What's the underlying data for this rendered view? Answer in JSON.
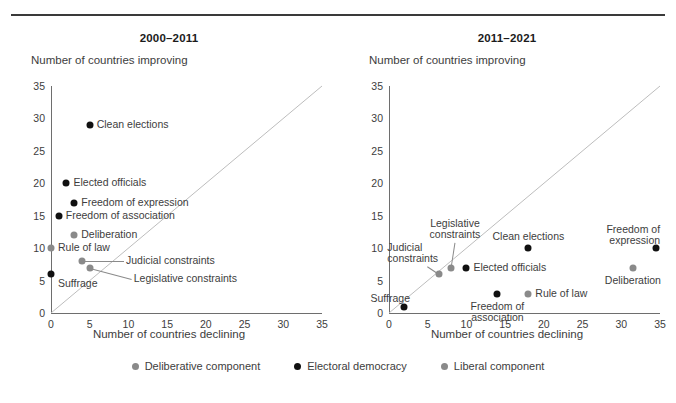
{
  "figure": {
    "x_axis_label": "Number of countries declining",
    "y_axis_label": "Number of countries improving",
    "ticks": [
      "0",
      "5",
      "10",
      "15",
      "20",
      "25",
      "30",
      "35"
    ],
    "colors": {
      "electoral_democracy": "#111111",
      "deliberative_component": "#8a8a8a",
      "liberal_component": "#8a8a8a",
      "axis": "#6e6e6e",
      "rule": "#3a3a3a",
      "text": "#3d3d3d"
    }
  },
  "legend": {
    "items": [
      {
        "label": "Deliberative component",
        "color": "#8a8a8a",
        "marker": "dot-icon"
      },
      {
        "label": "Electoral democracy",
        "color": "#111111",
        "marker": "dot-icon"
      },
      {
        "label": "Liberal component",
        "color": "#8a8a8a",
        "marker": "dot-icon"
      }
    ]
  },
  "chart_data": [
    {
      "type": "scatter",
      "title": "2000–2011",
      "xlabel": "Number of countries declining",
      "ylabel": "Number of countries improving",
      "xlim": [
        0,
        35
      ],
      "ylim": [
        0,
        35
      ],
      "xticks": [
        0,
        5,
        10,
        15,
        20,
        25,
        30,
        35
      ],
      "yticks": [
        0,
        5,
        10,
        15,
        20,
        25,
        30,
        35
      ],
      "grid": false,
      "reference_line": {
        "type": "diagonal",
        "from": [
          0,
          0
        ],
        "to": [
          35,
          35
        ],
        "color": "#bdbdbd"
      },
      "legend_position": "bottom-center-outside",
      "points": [
        {
          "label": "Clean elections",
          "x": 5,
          "y": 29,
          "series": "Electoral democracy",
          "color": "#111111",
          "label_pos": "right"
        },
        {
          "label": "Elected officials",
          "x": 2,
          "y": 20,
          "series": "Electoral democracy",
          "color": "#111111",
          "label_pos": "right"
        },
        {
          "label": "Freedom of expression",
          "x": 3,
          "y": 17,
          "series": "Electoral democracy",
          "color": "#111111",
          "label_pos": "right"
        },
        {
          "label": "Freedom of association",
          "x": 1,
          "y": 15,
          "series": "Electoral democracy",
          "color": "#111111",
          "label_pos": "right"
        },
        {
          "label": "Deliberation",
          "x": 3,
          "y": 12,
          "series": "Deliberative component",
          "color": "#8a8a8a",
          "label_pos": "right"
        },
        {
          "label": "Rule of law",
          "x": 0,
          "y": 10,
          "series": "Liberal component",
          "color": "#8a8a8a",
          "label_pos": "right"
        },
        {
          "label": "Judicial constraints",
          "x": 4,
          "y": 8,
          "series": "Liberal component",
          "color": "#8a8a8a",
          "label_pos": "leader-right"
        },
        {
          "label": "Legislative constraints",
          "x": 5,
          "y": 7,
          "series": "Liberal component",
          "color": "#8a8a8a",
          "label_pos": "leader-right"
        },
        {
          "label": "Suffrage",
          "x": 0,
          "y": 6,
          "series": "Electoral democracy",
          "color": "#111111",
          "label_pos": "below-right"
        }
      ]
    },
    {
      "type": "scatter",
      "title": "2011–2021",
      "xlabel": "Number of countries declining",
      "ylabel": "Number of countries improving",
      "xlim": [
        0,
        35
      ],
      "ylim": [
        0,
        35
      ],
      "xticks": [
        0,
        5,
        10,
        15,
        20,
        25,
        30,
        35
      ],
      "yticks": [
        0,
        5,
        10,
        15,
        20,
        25,
        30,
        35
      ],
      "grid": false,
      "reference_line": {
        "type": "diagonal",
        "from": [
          0,
          0
        ],
        "to": [
          35,
          35
        ],
        "color": "#bdbdbd"
      },
      "legend_position": "bottom-center-outside",
      "points": [
        {
          "label": "Legislative constraints",
          "x": 8,
          "y": 7,
          "series": "Liberal component",
          "color": "#8a8a8a",
          "label_pos": "leader-above"
        },
        {
          "label": "Judicial constraints",
          "x": 6.5,
          "y": 6,
          "series": "Liberal component",
          "color": "#8a8a8a",
          "label_pos": "leader-above-left"
        },
        {
          "label": "Elected officials",
          "x": 10,
          "y": 7,
          "series": "Electoral democracy",
          "color": "#111111",
          "label_pos": "right"
        },
        {
          "label": "Clean elections",
          "x": 18,
          "y": 10,
          "series": "Electoral democracy",
          "color": "#111111",
          "label_pos": "above"
        },
        {
          "label": "Freedom of expression",
          "x": 34.5,
          "y": 10,
          "series": "Electoral democracy",
          "color": "#111111",
          "label_pos": "above-left"
        },
        {
          "label": "Deliberation",
          "x": 31.5,
          "y": 7,
          "series": "Deliberative component",
          "color": "#8a8a8a",
          "label_pos": "below"
        },
        {
          "label": "Rule of law",
          "x": 18,
          "y": 3,
          "series": "Liberal component",
          "color": "#8a8a8a",
          "label_pos": "right"
        },
        {
          "label": "Freedom of association",
          "x": 14,
          "y": 3,
          "series": "Electoral democracy",
          "color": "#111111",
          "label_pos": "below"
        },
        {
          "label": "Suffrage",
          "x": 2,
          "y": 1,
          "series": "Electoral democracy",
          "color": "#111111",
          "label_pos": "above-left"
        }
      ]
    }
  ]
}
